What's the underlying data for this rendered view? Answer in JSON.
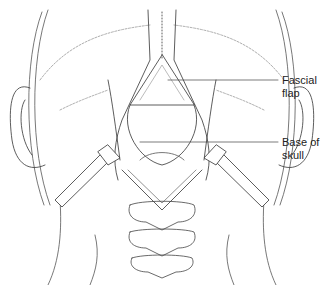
{
  "figure": {
    "labels": [
      {
        "id": "fascial-flap",
        "text": "Fascial\nflap",
        "leader_y": 80
      },
      {
        "id": "base-of-skull",
        "text": "Base of\nskull",
        "leader_y": 142
      }
    ],
    "colors": {
      "line": "#333333",
      "light_line": "#888888",
      "background": "#ffffff"
    }
  }
}
